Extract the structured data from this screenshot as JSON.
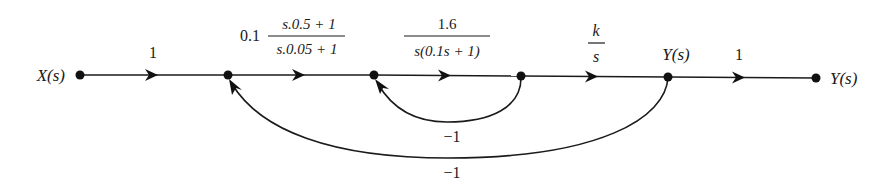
{
  "diagram": {
    "type": "signal-flow-graph",
    "nodes": [
      {
        "id": "n1",
        "label": "X(s)",
        "label_side": "left"
      },
      {
        "id": "n2",
        "label": ""
      },
      {
        "id": "n3",
        "label": ""
      },
      {
        "id": "n4",
        "label": ""
      },
      {
        "id": "n5",
        "label": "Y(s)",
        "label_side": "top"
      },
      {
        "id": "n6",
        "label": "Y(s)",
        "label_side": "right"
      }
    ],
    "forward_edges": [
      {
        "from": "n1",
        "to": "n2",
        "gain": {
          "text": "1"
        }
      },
      {
        "from": "n2",
        "to": "n3",
        "gain": {
          "prefix": "0.1",
          "numerator": "s.0.5 + 1",
          "denominator": "s.0.05 + 1"
        }
      },
      {
        "from": "n3",
        "to": "n4",
        "gain": {
          "numerator": "1.6",
          "denominator": "s(0.1s + 1)"
        }
      },
      {
        "from": "n4",
        "to": "n5",
        "gain": {
          "numerator": "k",
          "denominator": "s"
        }
      },
      {
        "from": "n5",
        "to": "n6",
        "gain": {
          "text": "1"
        }
      }
    ],
    "feedback_edges": [
      {
        "from": "n4",
        "to": "n3",
        "gain": "−1"
      },
      {
        "from": "n5",
        "to": "n2",
        "gain": "−1"
      }
    ]
  }
}
